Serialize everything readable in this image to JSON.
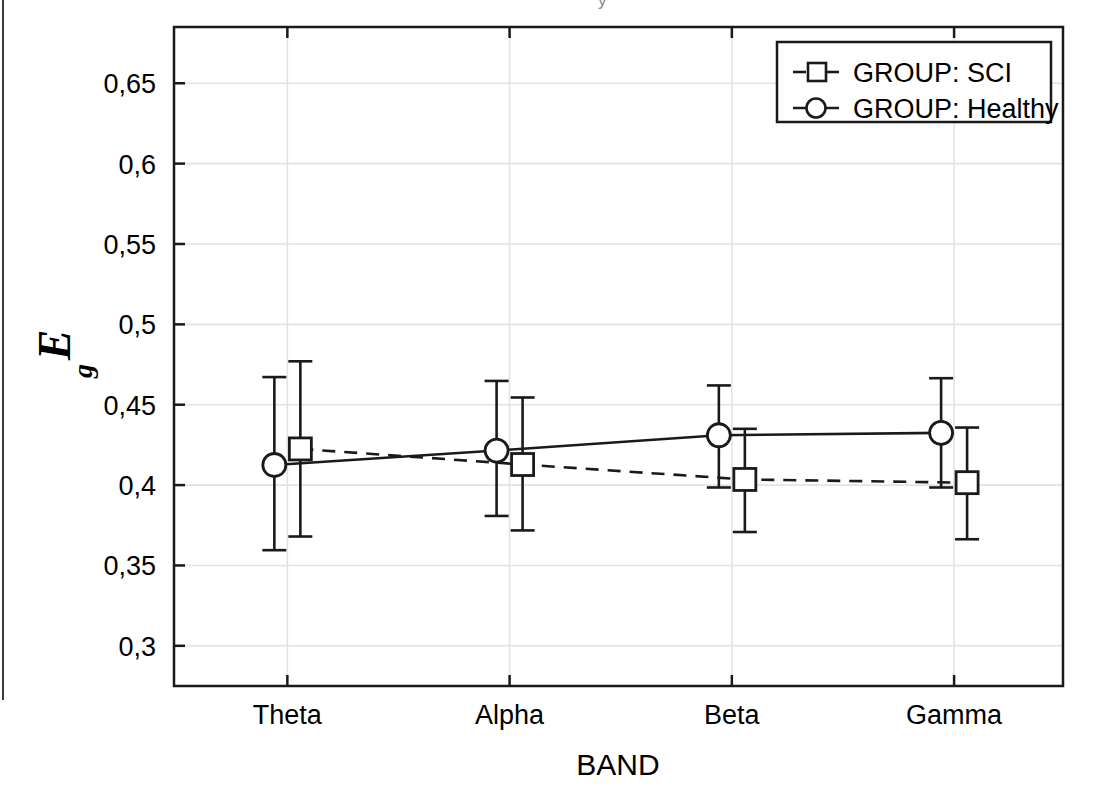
{
  "figure": {
    "background": "#ffffff",
    "line_color": "#1a1a1a",
    "grid_color": "#e3e3e3",
    "clipped_title_glyph": "y"
  },
  "axes": {
    "x_title": "BAND",
    "y_title_main": "E",
    "y_title_sub": "g",
    "x_categories": [
      "Theta",
      "Alpha",
      "Beta",
      "Gamma"
    ],
    "y_ticks": [
      "0,65",
      "0,6",
      "0,55",
      "0,5",
      "0,45",
      "0,4",
      "0,35",
      "0,3"
    ],
    "y_tick_values": [
      0.65,
      0.6,
      0.55,
      0.5,
      0.45,
      0.4,
      0.35,
      0.3
    ],
    "ylim": [
      0.275,
      0.685
    ],
    "grid": true,
    "decimal_separator": ","
  },
  "legend": {
    "position": "top-right",
    "entries": [
      {
        "label": "GROUP: SCI",
        "marker": "square",
        "line_style": "dashed"
      },
      {
        "label": "GROUP: Healthy",
        "marker": "circle",
        "line_style": "solid"
      }
    ]
  },
  "chart_data": {
    "type": "line",
    "title": "",
    "xlabel": "BAND",
    "ylabel": "Eg",
    "categories": [
      "Theta",
      "Alpha",
      "Beta",
      "Gamma"
    ],
    "ylim": [
      0.275,
      0.685
    ],
    "grid": true,
    "legend_position": "top-right",
    "error_bars": "mean with 95% confidence interval whiskers",
    "series": [
      {
        "name": "GROUP: SCI",
        "marker": "square",
        "line_style": "dashed",
        "values": [
          0.4225,
          0.4128,
          0.4035,
          0.4015
        ],
        "err_low": [
          0.368,
          0.3718,
          0.3708,
          0.3663
        ],
        "err_high": [
          0.477,
          0.4545,
          0.435,
          0.4358
        ]
      },
      {
        "name": "GROUP: Healthy",
        "marker": "circle",
        "line_style": "solid",
        "values": [
          0.4125,
          0.4215,
          0.431,
          0.4325
        ],
        "err_low": [
          0.3595,
          0.3808,
          0.3985,
          0.3985
        ],
        "err_high": [
          0.4672,
          0.4648,
          0.462,
          0.4665
        ]
      }
    ]
  }
}
